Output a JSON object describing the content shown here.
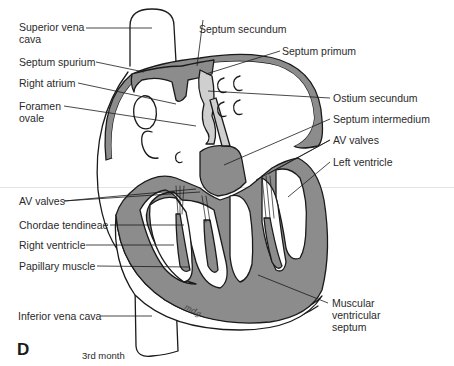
{
  "figure": {
    "panel_letter": "D",
    "caption": "3rd month",
    "artist_initials": "mdg",
    "colors": {
      "tissue_fill": "#8c8c8c",
      "outline": "#1a1a1a",
      "light_fill": "#cfcfcf",
      "background": "#ffffff"
    }
  },
  "labels": {
    "left": [
      {
        "id": "superior-vena-cava",
        "text": "Superior vena\ncava"
      },
      {
        "id": "septum-spurium",
        "text": "Septum spurium"
      },
      {
        "id": "right-atrium",
        "text": "Right atrium"
      },
      {
        "id": "foramen-ovale",
        "text": "Foramen\novale"
      },
      {
        "id": "av-valves-left",
        "text": "AV valves"
      },
      {
        "id": "chordae-tendineae",
        "text": "Chordae tendineae"
      },
      {
        "id": "right-ventricle",
        "text": "Right ventricle"
      },
      {
        "id": "papillary-muscle",
        "text": "Papillary muscle"
      },
      {
        "id": "inferior-vena-cava",
        "text": "Inferior vena cava"
      }
    ],
    "right": [
      {
        "id": "septum-secundum",
        "text": "Septum secundum"
      },
      {
        "id": "septum-primum",
        "text": "Septum primum"
      },
      {
        "id": "ostium-secundum",
        "text": "Ostium secundum"
      },
      {
        "id": "septum-intermedium",
        "text": "Septum intermedium"
      },
      {
        "id": "av-valves-right",
        "text": "AV valves"
      },
      {
        "id": "left-ventricle",
        "text": "Left ventricle"
      },
      {
        "id": "muscular-ventricular-septum",
        "text": "Muscular\nventricular\nseptum"
      }
    ]
  }
}
